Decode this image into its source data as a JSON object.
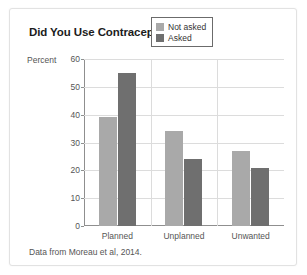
{
  "card": {
    "title": "Did You Use Contraception?",
    "source_note": "Data from Moreau et al, 2014."
  },
  "legend": {
    "position": "top-right",
    "items": [
      {
        "label": "Not asked",
        "color": "#a9a9a9"
      },
      {
        "label": "Asked",
        "color": "#6f6f6f"
      }
    ]
  },
  "chart_data": {
    "type": "bar",
    "title": "Did You Use Contraception?",
    "xlabel": "",
    "ylabel": "Percent",
    "ylim": [
      0,
      60
    ],
    "yticks": [
      0,
      10,
      20,
      30,
      40,
      50,
      60
    ],
    "grid": true,
    "legend_position": "top-right",
    "categories": [
      "Planned",
      "Unplanned",
      "Unwanted"
    ],
    "series": [
      {
        "name": "Not asked",
        "color": "#a9a9a9",
        "values": [
          39,
          34,
          27
        ]
      },
      {
        "name": "Asked",
        "color": "#6f6f6f",
        "values": [
          55,
          24,
          21
        ]
      }
    ],
    "annotations": [
      "Data from Moreau et al, 2014."
    ]
  }
}
